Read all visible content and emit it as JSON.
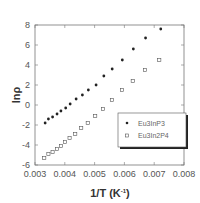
{
  "chart_data": {
    "type": "scatter",
    "title": "",
    "xlabel": "1/T (K",
    "xlabel_sup": "-1",
    "xlabel_end": ")",
    "ylabel": "lnρ",
    "xlim": [
      0.003,
      0.008
    ],
    "ylim": [
      -6,
      8
    ],
    "xticks": [
      0.003,
      0.004,
      0.005,
      0.006,
      0.007,
      0.008
    ],
    "xtick_labels": [
      "0.003",
      "0.004",
      "0.005",
      "0.006",
      "0.007",
      "0.008"
    ],
    "yticks": [
      -6,
      -4,
      -2,
      0,
      2,
      4,
      6,
      8
    ],
    "ytick_labels": [
      "-6",
      "-4",
      "-2",
      "0",
      "2",
      "4",
      "6",
      "8"
    ],
    "grid": false,
    "legend_position": "center-right",
    "series": [
      {
        "name": "Eu3InP3",
        "marker": "filled-circle",
        "color": "#222222",
        "x": [
          0.00334,
          0.00345,
          0.00359,
          0.00374,
          0.00387,
          0.00403,
          0.00418,
          0.00438,
          0.00459,
          0.00479,
          0.00505,
          0.00531,
          0.00559,
          0.00593,
          0.0063,
          0.00671,
          0.00722
        ],
        "y": [
          -1.8,
          -1.4,
          -1.2,
          -0.9,
          -0.6,
          -0.3,
          0.1,
          0.6,
          1.0,
          1.5,
          2.0,
          2.9,
          3.6,
          4.5,
          5.6,
          6.7,
          7.6
        ]
      },
      {
        "name": "Eu3In2P4",
        "marker": "open-square",
        "color": "#555555",
        "x": [
          0.00331,
          0.00345,
          0.00359,
          0.00374,
          0.00387,
          0.00401,
          0.00416,
          0.00435,
          0.00455,
          0.00477,
          0.00502,
          0.00528,
          0.00558,
          0.00592,
          0.00628,
          0.00669,
          0.00717
        ],
        "y": [
          -5.3,
          -4.9,
          -4.7,
          -4.4,
          -4.1,
          -3.7,
          -3.3,
          -2.9,
          -2.3,
          -1.8,
          -1.1,
          -0.4,
          0.5,
          1.5,
          2.4,
          3.5,
          4.5
        ]
      }
    ]
  }
}
